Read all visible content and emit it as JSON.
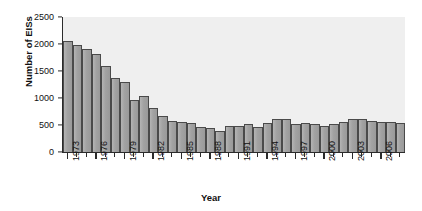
{
  "chart_data": {
    "type": "bar",
    "title": "",
    "xlabel": "Year",
    "ylabel": "Number of EISs",
    "ylim": [
      0,
      2500
    ],
    "ytick_values": [
      0,
      500,
      1000,
      1500,
      2000,
      2500
    ],
    "ytick_labels": [
      "0",
      "500",
      "1000",
      "1500",
      "2000",
      "2500"
    ],
    "grid": false,
    "legend": "none",
    "bar_color": "#a6a6a6",
    "bar_edge_color": "#4a4a4a",
    "plot_background": "#efefef",
    "xtick_label_rotation": -90,
    "xtick_label_interval_years": 3,
    "xtick_labels": [
      "1973",
      "1976",
      "1979",
      "1982",
      "1985",
      "1988",
      "1991",
      "1994",
      "1997",
      "2000",
      "2003",
      "2006"
    ],
    "categories": [
      "1973",
      "1974",
      "1975",
      "1976",
      "1977",
      "1978",
      "1979",
      "1980",
      "1981",
      "1982",
      "1983",
      "1984",
      "1985",
      "1986",
      "1987",
      "1988",
      "1989",
      "1990",
      "1991",
      "1992",
      "1993",
      "1994",
      "1995",
      "1996",
      "1997",
      "1998",
      "1999",
      "2000",
      "2001",
      "2002",
      "2003",
      "2004",
      "2005",
      "2006",
      "2007",
      "2008"
    ],
    "values": [
      2060,
      1990,
      1900,
      1820,
      1590,
      1370,
      1290,
      970,
      1040,
      820,
      670,
      580,
      560,
      530,
      460,
      450,
      385,
      480,
      480,
      515,
      470,
      545,
      615,
      605,
      525,
      540,
      525,
      485,
      520,
      555,
      615,
      620,
      575,
      550,
      550,
      545
    ]
  }
}
